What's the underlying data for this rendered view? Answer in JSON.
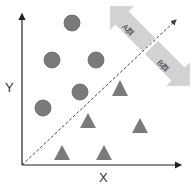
{
  "diagram": {
    "axes": {
      "x_label": "X",
      "y_label": "Y"
    },
    "groups": [
      {
        "name": "A群",
        "shape": "circle",
        "color": "#7a7a7a",
        "points": [
          [
            72,
            23
          ],
          [
            52,
            60
          ],
          [
            96,
            60
          ],
          [
            80,
            92
          ],
          [
            43,
            108
          ]
        ]
      },
      {
        "name": "B群",
        "shape": "triangle",
        "color": "#7a7a7a",
        "points": [
          [
            120,
            88
          ],
          [
            88,
            122
          ],
          [
            140,
            128
          ],
          [
            62,
            155
          ],
          [
            104,
            155
          ]
        ]
      }
    ],
    "separator": "dashed diagonal boundary line",
    "arrow_labels": {
      "a": "A群",
      "b": "B群"
    },
    "colors": {
      "arrow_fill": "#d2d2d2",
      "marker": "#7a7a7a",
      "axis": "#222222"
    }
  }
}
